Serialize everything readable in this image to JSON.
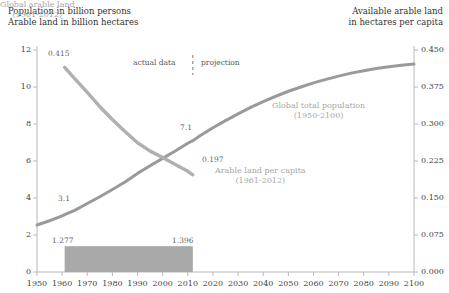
{
  "left_axis_title": {
    "line1": "Population in billion persons",
    "line2": "Arable land in billion hectares"
  },
  "right_axis_title": {
    "line1": "Available arable land",
    "line2": "in hectares per capita"
  },
  "phase": {
    "actual": "actual data",
    "projection": "projection",
    "divider_year": 2012
  },
  "annotations": {
    "arable_start": "0.415",
    "arable_end": "0.197",
    "population_start": "3.1",
    "population_mid": "7.1",
    "bar_start": "1.277",
    "bar_end": "1.396"
  },
  "series_labels": {
    "population": {
      "name": "Global total population",
      "range": "(1950-2100)"
    },
    "per_capita": {
      "name": "Arable land per capita",
      "range": "(1961-2012)"
    },
    "arable_total": {
      "name": "Global arable land",
      "range": "(1961-2012)"
    }
  },
  "colors": {
    "population_line": "#9a9a9a",
    "per_capita_line": "#b0b0b0",
    "bar_fill": "#a9a9a9",
    "axis": "#b9b9b9",
    "label_gray": "#a6a6a6"
  },
  "chart_data": {
    "type": "line",
    "title": "",
    "xlabel": "",
    "ylabel": "Population in billion persons / Arable land in billion hectares",
    "y2label": "Available arable land in hectares per capita",
    "grid": false,
    "legend": "inline-annotations",
    "xlim": [
      1950,
      2100
    ],
    "ylim": [
      0,
      12
    ],
    "y2lim": [
      0.0,
      0.45
    ],
    "xticks": [
      1950,
      1960,
      1970,
      1980,
      1990,
      2000,
      2010,
      2020,
      2030,
      2040,
      2050,
      2060,
      2070,
      2080,
      2090,
      2100
    ],
    "yticks": [
      0,
      2,
      4,
      6,
      8,
      10,
      12
    ],
    "y2ticks": [
      "0.000",
      "0.075",
      "0.150",
      "0.225",
      "0.300",
      "0.375",
      "0.450"
    ],
    "series": [
      {
        "name": "Global total population",
        "range": "(1950-2100)",
        "axis": "left",
        "units": "billion persons",
        "x": [
          1950,
          1955,
          1960,
          1961,
          1965,
          1970,
          1975,
          1980,
          1985,
          1990,
          1995,
          2000,
          2005,
          2010,
          2012,
          2015,
          2020,
          2025,
          2030,
          2035,
          2040,
          2045,
          2050,
          2055,
          2060,
          2065,
          2070,
          2075,
          2080,
          2085,
          2090,
          2095,
          2100
        ],
        "values": [
          2.54,
          2.77,
          3.03,
          3.1,
          3.33,
          3.7,
          4.07,
          4.46,
          4.87,
          5.33,
          5.74,
          6.14,
          6.54,
          6.96,
          7.1,
          7.38,
          7.8,
          8.18,
          8.55,
          8.9,
          9.21,
          9.5,
          9.77,
          10.0,
          10.22,
          10.41,
          10.59,
          10.75,
          10.88,
          11.0,
          11.1,
          11.18,
          11.24
        ]
      },
      {
        "name": "Arable land per capita",
        "range": "(1961-2012)",
        "axis": "right",
        "units": "hectares per capita",
        "x": [
          1961,
          1965,
          1970,
          1975,
          1980,
          1985,
          1990,
          1995,
          2000,
          2005,
          2010,
          2012
        ],
        "values": [
          0.415,
          0.392,
          0.364,
          0.335,
          0.309,
          0.285,
          0.262,
          0.245,
          0.232,
          0.218,
          0.204,
          0.197
        ]
      },
      {
        "name": "Global arable land",
        "range": "(1961-2012)",
        "axis": "left",
        "type": "bar",
        "units": "billion hectares",
        "x_start": 1961,
        "x_end": 2012,
        "value_start": 1.277,
        "value_end": 1.396
      }
    ]
  }
}
